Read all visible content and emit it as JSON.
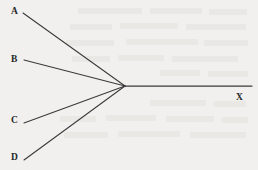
{
  "figure": {
    "type": "ray-convergence-diagram",
    "background_color": "#f1f0ee",
    "stroke_color": "#3a3a3c",
    "label_color": "#262628",
    "width": 258,
    "height": 170,
    "vertex": {
      "x": 125,
      "y": 86
    },
    "rays": [
      {
        "id": "a",
        "label": "A",
        "label_x": 14,
        "label_y": 11,
        "start_x": 23,
        "start_y": 13,
        "end_x": 125,
        "end_y": 86
      },
      {
        "id": "b",
        "label": "B",
        "label_x": 14,
        "label_y": 59,
        "start_x": 24,
        "start_y": 60,
        "end_x": 125,
        "end_y": 86
      },
      {
        "id": "c",
        "label": "C",
        "label_x": 14,
        "label_y": 120,
        "start_x": 24,
        "start_y": 123,
        "end_x": 125,
        "end_y": 86
      },
      {
        "id": "d",
        "label": "D",
        "label_x": 14,
        "label_y": 157,
        "start_x": 24,
        "start_y": 160,
        "end_x": 125,
        "end_y": 86
      }
    ],
    "axis": {
      "label": "X",
      "label_x": 240,
      "label_y": 98,
      "start_x": 125,
      "start_y": 86,
      "end_x": 252,
      "end_y": 86
    }
  }
}
